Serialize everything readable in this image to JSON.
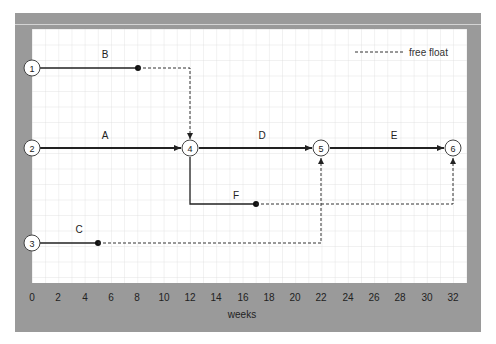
{
  "diagram": {
    "type": "network-timeline",
    "legend": {
      "label": "free float",
      "style": "dashed"
    },
    "x_axis": {
      "label": "weeks",
      "ticks": [
        "0",
        "2",
        "4",
        "6",
        "8",
        "10",
        "12",
        "14",
        "16",
        "18",
        "20",
        "22",
        "24",
        "26",
        "28",
        "30",
        "32"
      ],
      "range": [
        0,
        32
      ]
    },
    "nodes": [
      {
        "id": "1",
        "label": "1",
        "week": 0,
        "row": "row1"
      },
      {
        "id": "2",
        "label": "2",
        "week": 0,
        "row": "row2"
      },
      {
        "id": "3",
        "label": "3",
        "week": 0,
        "row": "row3"
      },
      {
        "id": "4",
        "label": "4",
        "week": 12,
        "row": "row2"
      },
      {
        "id": "5",
        "label": "5",
        "week": 22,
        "row": "row2"
      },
      {
        "id": "6",
        "label": "6",
        "week": 32,
        "row": "row2"
      }
    ],
    "activities": [
      {
        "label": "A",
        "from": "2",
        "to": "4",
        "start": 0,
        "end": 12,
        "critical": true
      },
      {
        "label": "B",
        "from": "1",
        "to": "4",
        "start": 0,
        "end": 8,
        "free_float_end": 12
      },
      {
        "label": "C",
        "from": "3",
        "to": "5",
        "start": 0,
        "end": 5,
        "free_float_end": 22
      },
      {
        "label": "D",
        "from": "4",
        "to": "5",
        "start": 12,
        "end": 22,
        "critical": true
      },
      {
        "label": "E",
        "from": "5",
        "to": "6",
        "start": 22,
        "end": 32,
        "critical": true
      },
      {
        "label": "F",
        "from": "4",
        "to": "6",
        "start": 12,
        "end": 17,
        "free_float_end": 32
      }
    ]
  },
  "labels": {
    "node1": "1",
    "node2": "2",
    "node3": "3",
    "node4": "4",
    "node5": "5",
    "node6": "6",
    "actA": "A",
    "actB": "B",
    "actC": "C",
    "actD": "D",
    "actE": "E",
    "actF": "F",
    "legend": "free float",
    "xlabel": "weeks",
    "ticks": [
      "0",
      "2",
      "4",
      "6",
      "8",
      "10",
      "12",
      "14",
      "16",
      "18",
      "20",
      "22",
      "24",
      "26",
      "28",
      "30",
      "32"
    ]
  }
}
